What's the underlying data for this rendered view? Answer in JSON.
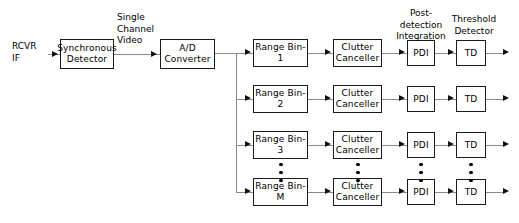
{
  "diagram": {
    "input_label": "RCVR\nIF",
    "stage1_label": "Synchronous\nDetector",
    "interstage_label": "Single\nChannel\nVideo",
    "stage2_label": "A/D\nConverter",
    "pdi_header": "Post-\ndetection\nIntegration",
    "td_header": "Threshold\nDetector",
    "ellipsis_dot_count": 3,
    "colors": {
      "background": "#ffffff",
      "box_border": "#1a1a1a",
      "connector": "#8a8a8a",
      "arrow": "#111111",
      "text": "#000000"
    },
    "channels": [
      {
        "range_bin": "Range  Bin-1",
        "clutter_canceller": "Clutter\nCanceller",
        "pdi": "PDI",
        "td": "TD"
      },
      {
        "range_bin": "Range  Bin-2",
        "clutter_canceller": "Clutter\nCanceller",
        "pdi": "PDI",
        "td": "TD"
      },
      {
        "range_bin": "Range  Bin-3",
        "clutter_canceller": "Clutter\nCanceller",
        "pdi": "PDI",
        "td": "TD"
      },
      {
        "range_bin": "Range  Bin-M",
        "clutter_canceller": "Clutter\nCanceller",
        "pdi": "PDI",
        "td": "TD"
      }
    ]
  }
}
